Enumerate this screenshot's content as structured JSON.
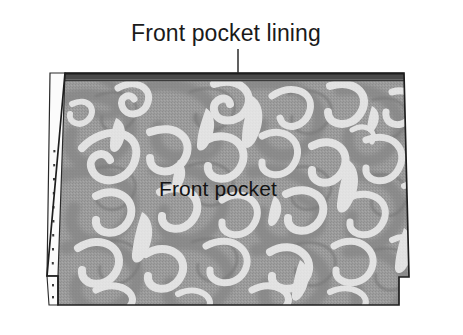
{
  "figure": {
    "kind": "sewing-pattern-illustration",
    "background_color": "#ffffff"
  },
  "labels": {
    "lining": "Front pocket lining",
    "pocket": "Front pocket"
  },
  "leader_line": {
    "name": "lining-leader-line",
    "color": "#2b2b2b",
    "from_x": 238,
    "from_y": 49,
    "to_x": 238,
    "to_y": 73
  },
  "pattern_piece": {
    "outline_color": "#1e1e1e",
    "outline_width": 1.6,
    "fabric_base_color": "#9c9c9c",
    "fabric_shadow_color": "#868686",
    "motif_color": "#fdfdfd",
    "motif_outline_color": "#7b7b7b",
    "top_band_color": "#4a4a4a",
    "seam_allowance_color": "#fbfbfb",
    "notch_mark_color": "#3a3a3a",
    "corners": {
      "top_left": [
        65,
        73
      ],
      "top_right": [
        404,
        73
      ],
      "bottom_right_step_top": [
        409,
        277
      ],
      "bottom_right_step_in": [
        399,
        277
      ],
      "bottom_right": [
        399,
        305
      ],
      "bottom_left": [
        58,
        305
      ],
      "bottom_left_step_up": [
        58,
        276
      ],
      "left_notch_out": [
        47,
        276
      ]
    }
  },
  "colors": {
    "ink": "#1a1a1a",
    "paper": "#ffffff",
    "gray_mid": "#9c9c9c",
    "gray_dark": "#7b7b7b",
    "gray_band": "#4a4a4a",
    "white_motif": "#fdfdfd"
  }
}
